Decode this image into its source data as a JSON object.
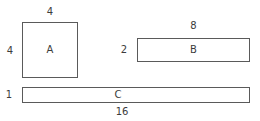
{
  "diagram": {
    "background_color": "#ffffff",
    "stroke_color": "#5a5a5a",
    "text_color": "#3c3c3c",
    "shapes": [
      {
        "id": "A",
        "letter": "A",
        "type": "square",
        "width_label": "4",
        "height_label": "4"
      },
      {
        "id": "B",
        "letter": "B",
        "type": "rectangle",
        "width_label": "8",
        "height_label": "2"
      },
      {
        "id": "C",
        "letter": "C",
        "type": "rectangle",
        "width_label": "16",
        "height_label": "1"
      }
    ]
  }
}
